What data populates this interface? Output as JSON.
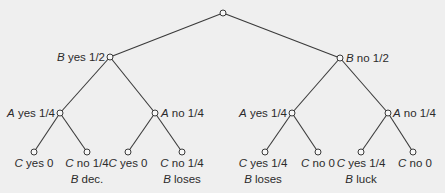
{
  "diagram": {
    "type": "probability-tree",
    "colors": {
      "background": "#efefef",
      "line": "#3a3a3a",
      "text": "#2b2b2b"
    },
    "root": {
      "x": 223,
      "y": 13
    },
    "level1": [
      {
        "id": "b_yes",
        "x": 110,
        "y": 57,
        "var": "B",
        "text": " yes 1/2"
      },
      {
        "id": "b_no",
        "x": 340,
        "y": 58,
        "var": "B",
        "text": " no 1/2"
      }
    ],
    "level2": [
      {
        "id": "a_yes_1",
        "x": 60,
        "y": 113,
        "var": "A",
        "text": " yes 1/4"
      },
      {
        "id": "a_no_1",
        "x": 155,
        "y": 113,
        "var": "A",
        "text": " no 1/4"
      },
      {
        "id": "a_yes_2",
        "x": 292,
        "y": 113,
        "var": "A",
        "text": " yes 1/4"
      },
      {
        "id": "a_no_2",
        "x": 388,
        "y": 113,
        "var": "A",
        "text": " no 1/4"
      }
    ],
    "leaves": [
      {
        "x": 34,
        "y": 152,
        "var": "C",
        "text": " yes 0",
        "note_var": "",
        "note": ""
      },
      {
        "x": 87,
        "y": 152,
        "var": "C",
        "text": " no 1/4",
        "note_var": "B",
        "note": " dec."
      },
      {
        "x": 128,
        "y": 152,
        "var": "C",
        "text": " yes 0",
        "note_var": "",
        "note": ""
      },
      {
        "x": 182,
        "y": 152,
        "var": "C",
        "text": " no 1/4",
        "note_var": "B",
        "note": " loses"
      },
      {
        "x": 265,
        "y": 152,
        "var": "C",
        "text": " yes 1/4",
        "note_var": "B",
        "note": " loses"
      },
      {
        "x": 318,
        "y": 152,
        "var": "C",
        "text": " no 0",
        "note_var": "",
        "note": ""
      },
      {
        "x": 361,
        "y": 152,
        "var": "C",
        "text": " yes 1/4",
        "note_var": "B",
        "note": " luck"
      },
      {
        "x": 413,
        "y": 152,
        "var": "C",
        "text": " no 0",
        "note_var": "",
        "note": ""
      }
    ]
  }
}
